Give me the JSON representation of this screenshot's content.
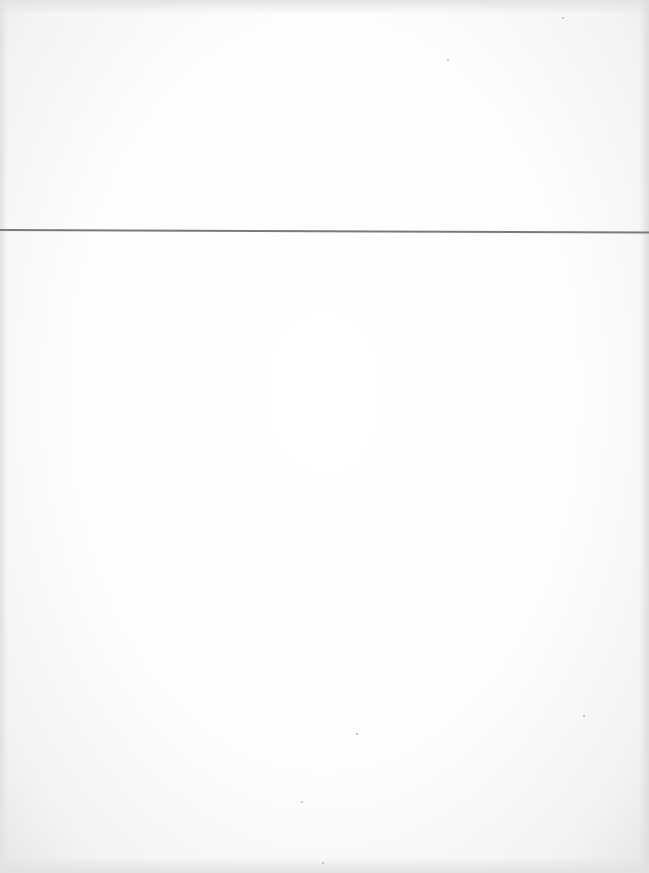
{
  "page": {
    "type": "blank scanned page",
    "background_color": "#ffffff",
    "rule": {
      "orientation": "horizontal",
      "y_px": 230,
      "color": "#7a7a7a"
    },
    "text_content": []
  }
}
